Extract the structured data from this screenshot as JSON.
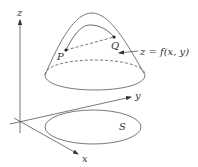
{
  "diagram": {
    "axes": {
      "x_label": "x",
      "y_label": "y",
      "z_label": "z"
    },
    "points": {
      "p_label": "P",
      "q_label": "Q"
    },
    "surface_label": "z = f(x, y)",
    "region_label": "S",
    "colors": {
      "stroke": "#444444",
      "background": "#ffffff"
    }
  }
}
